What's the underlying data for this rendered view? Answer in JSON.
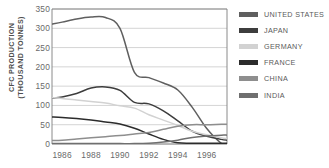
{
  "chart_data": {
    "type": "line",
    "title": "",
    "subtitle": "",
    "xlabel": "",
    "ylabel": "CFC PRODUCTION\n(THOUSAND TONNES)",
    "ylabel_line1": "CFC PRODUCTION",
    "ylabel_line2": "(THOUSAND TONNES)",
    "grid": true,
    "legend_position": "right",
    "xlim": [
      1985.3,
      1997.4
    ],
    "ylim": [
      0,
      350
    ],
    "yticks": [
      0,
      50,
      100,
      150,
      200,
      250,
      300,
      350
    ],
    "ytick_labels": [
      "0",
      "50",
      "100",
      "150",
      "200",
      "250",
      "300",
      "350"
    ],
    "xticks": [
      1986,
      1988,
      1990,
      1992,
      1994,
      1996
    ],
    "xtick_labels": [
      "1986",
      "1988",
      "1990",
      "1992",
      "1994",
      "1996"
    ],
    "x": [
      1985.3,
      1986,
      1987,
      1988,
      1989,
      1990,
      1991,
      1992,
      1993,
      1994,
      1995,
      1996,
      1997,
      1997.4
    ],
    "series": [
      {
        "name": "UNITED STATES",
        "color": "#5f5f5f",
        "values": [
          311,
          316,
          324,
          329,
          328,
          300,
          186,
          172,
          158,
          140,
          95,
          40,
          2,
          0
        ]
      },
      {
        "name": "JAPAN",
        "color": "#3d3d3d",
        "values": [
          119,
          122,
          131,
          145,
          148,
          139,
          108,
          104,
          86,
          60,
          33,
          20,
          12,
          10
        ]
      },
      {
        "name": "GERMANY",
        "color": "#d2d2d2",
        "values": [
          120,
          118,
          114,
          110,
          106,
          99,
          93,
          76,
          62,
          48,
          33,
          24,
          16,
          14
        ]
      },
      {
        "name": "FRANCE",
        "color": "#2c2c2c",
        "values": [
          70,
          69,
          66,
          62,
          57,
          52,
          41,
          26,
          12,
          3,
          2,
          2,
          2,
          2
        ]
      },
      {
        "name": "CHINA",
        "color": "#8e8e8e",
        "values": [
          9,
          10,
          13,
          16,
          19,
          22,
          26,
          30,
          38,
          46,
          50,
          50,
          51,
          51
        ]
      },
      {
        "name": "INDIA",
        "color": "#6f6f6f",
        "values": [
          1,
          1,
          1,
          1,
          1,
          1,
          1,
          2,
          5,
          10,
          17,
          21,
          23,
          23
        ]
      }
    ],
    "annotations": []
  },
  "legend": {
    "items": [
      {
        "label": "UNITED STATES",
        "color": "#5f5f5f"
      },
      {
        "label": "JAPAN",
        "color": "#3d3d3d"
      },
      {
        "label": "GERMANY",
        "color": "#d2d2d2"
      },
      {
        "label": "FRANCE",
        "color": "#2c2c2c"
      },
      {
        "label": "CHINA",
        "color": "#8e8e8e"
      },
      {
        "label": "INDIA",
        "color": "#6f6f6f"
      }
    ]
  },
  "colors": {
    "grid": "#c9c9c9",
    "frame": "#7d7d7d",
    "tick_text": "#6a6a6a",
    "axis_title": "#4f4f4f",
    "background": "#ffffff"
  }
}
